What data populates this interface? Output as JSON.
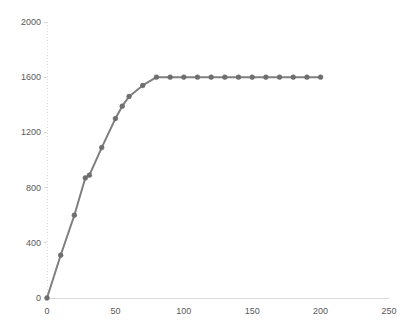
{
  "chart_data": {
    "type": "line",
    "title": "",
    "subtitle": "",
    "xlabel": "",
    "ylabel": "",
    "xlim": [
      0,
      250
    ],
    "ylim": [
      0,
      2000
    ],
    "xticks": [
      0,
      50,
      100,
      150,
      200,
      250
    ],
    "yticks": [
      0,
      400,
      800,
      1200,
      1600,
      2000
    ],
    "xtick_labels": [
      "0",
      "50",
      "100",
      "150",
      "200",
      "250"
    ],
    "ytick_labels": [
      "0",
      "400",
      "800",
      "1200",
      "1600",
      "2000"
    ],
    "grid": false,
    "legend": null,
    "legend_position": "none",
    "markers": true,
    "marker_shape": "circle",
    "series": [
      {
        "name": "series-1",
        "color": "#7f7f7f",
        "marker_color": "#6e6e6e",
        "x": [
          0,
          10,
          20,
          28,
          31,
          40,
          50,
          55,
          60,
          70,
          80,
          90,
          100,
          110,
          120,
          130,
          140,
          150,
          160,
          170,
          180,
          190,
          200
        ],
        "y": [
          0,
          310,
          600,
          870,
          890,
          1090,
          1300,
          1390,
          1460,
          1540,
          1600,
          1600,
          1600,
          1600,
          1600,
          1600,
          1600,
          1600,
          1600,
          1600,
          1600,
          1600,
          1600
        ]
      }
    ]
  },
  "axes": {
    "x_axis_color": "#d9d9d9",
    "y_axis_color": "#d9d9d9",
    "tick_label_color": "#595959"
  }
}
